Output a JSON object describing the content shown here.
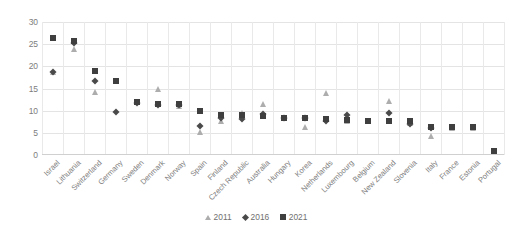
{
  "chart_data": {
    "type": "scatter",
    "title": "",
    "xlabel": "",
    "ylabel": "",
    "ylim": [
      0,
      30
    ],
    "yticks": [
      0,
      5,
      10,
      15,
      20,
      25,
      30
    ],
    "grid": true,
    "legend_position": "bottom",
    "categories": [
      "Israel",
      "Lithuania",
      "Switzerland",
      "Germany",
      "Sweden",
      "Denmark",
      "Norway",
      "Spain",
      "Finland",
      "Czech Republic",
      "Australia",
      "Hungary",
      "Korea",
      "Netherlands",
      "Luxembourg",
      "Belgium",
      "New Zealand",
      "Slovenia",
      "Italy",
      "France",
      "Estonia",
      "Portugal"
    ],
    "series": [
      {
        "name": "2011",
        "marker": "triangle",
        "color": "#adadad",
        "values": [
          18.7,
          23.9,
          14.3,
          null,
          11.9,
          15.0,
          11.0,
          5.3,
          7.6,
          9.5,
          11.4,
          8.4,
          6.3,
          13.9,
          7.6,
          null,
          12.2,
          7.2,
          4.3,
          6.2,
          6.2,
          null
        ]
      },
      {
        "name": "2016",
        "marker": "diamond",
        "color": "#4a4a4a",
        "values": [
          18.8,
          25.3,
          16.6,
          9.6,
          11.8,
          11.2,
          11.2,
          6.6,
          8.4,
          8.2,
          9.3,
          8.4,
          8.3,
          7.6,
          9.0,
          null,
          9.4,
          7.0,
          6.1,
          null,
          null,
          null
        ]
      },
      {
        "name": "2021",
        "marker": "square",
        "color": "#3f3f3f",
        "values": [
          26.3,
          25.7,
          19.0,
          16.6,
          11.9,
          11.4,
          11.4,
          9.9,
          9.0,
          9.0,
          8.9,
          8.3,
          8.3,
          8.2,
          8.0,
          7.7,
          7.7,
          7.6,
          6.4,
          6.4,
          6.3,
          0.8
        ]
      }
    ]
  },
  "legend": {
    "items": [
      {
        "label": "2011",
        "marker": "triangle-icon"
      },
      {
        "label": "2016",
        "marker": "diamond-icon"
      },
      {
        "label": "2021",
        "marker": "square-icon"
      }
    ]
  },
  "colors": {
    "series_2011": "#adadad",
    "series_2016": "#4a4a4a",
    "series_2021": "#3f3f3f",
    "grid": "#e4e4e4",
    "text": "#7d7d7d",
    "background": "#ffffff"
  }
}
